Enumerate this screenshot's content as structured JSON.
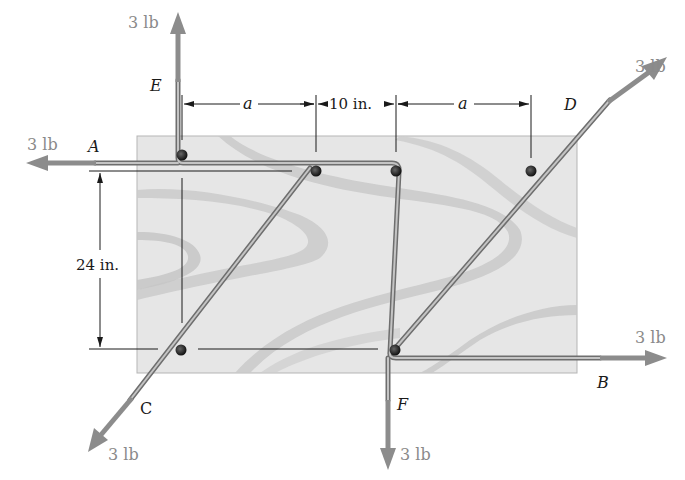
{
  "figure": {
    "type": "statics diagram: cord wrapped around pegs on a board",
    "board_color": "#e4e4e4",
    "grain_color": "#c9c9c9",
    "cord_color": "#9a9a9a",
    "arrow_color": "#8c8c8c",
    "peg_color": "#222222"
  },
  "forces": {
    "E": {
      "label": "3 lb",
      "direction": "up"
    },
    "A": {
      "label": "3 lb",
      "direction": "left"
    },
    "D": {
      "label": "3 lb",
      "direction": "up-right"
    },
    "B": {
      "label": "3 lb",
      "direction": "right"
    },
    "C": {
      "label": "3 lb",
      "direction": "down-left"
    },
    "F": {
      "label": "3 lb",
      "direction": "down"
    }
  },
  "points": {
    "A": "A",
    "B": "B",
    "C": "C",
    "D": "D",
    "E": "E",
    "F": "F"
  },
  "dimensions": {
    "horizontal_1": "a",
    "horizontal_2": "10 in.",
    "horizontal_3": "a",
    "vertical": "24 in."
  }
}
